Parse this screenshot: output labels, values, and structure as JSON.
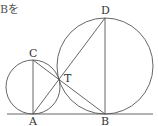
{
  "text_fragment": "Bを",
  "diagram": {
    "labels": {
      "A": "A",
      "B": "B",
      "C": "C",
      "D": "D",
      "T": "T"
    },
    "stroke_color": "#555555"
  }
}
